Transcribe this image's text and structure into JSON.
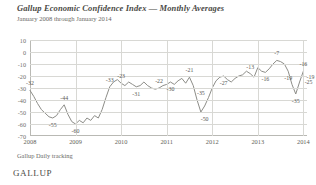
{
  "header": {
    "title": "Gallup Economic Confidence Index — Monthly Averages",
    "subtitle": "January 2008 through January 2014"
  },
  "footer": {
    "source": "Gallup Daily tracking",
    "logo": "GALLUP"
  },
  "chart_data": {
    "type": "line",
    "title": "Gallup Economic Confidence Index — Monthly Averages",
    "subtitle": "January 2008 through January 2014",
    "xlabel": "",
    "ylabel": "",
    "ylim": [
      -70,
      10
    ],
    "yticks": [
      10,
      0,
      -10,
      -20,
      -30,
      -40,
      -50,
      -60,
      -70
    ],
    "ytick_labels": [
      "10",
      "0",
      "-10",
      "-20",
      "-30",
      "-40",
      "-50",
      "-60",
      "-70"
    ],
    "xticks": [
      2008,
      2009,
      2010,
      2011,
      2012,
      2013,
      2014
    ],
    "xtick_labels": [
      "2008",
      "2009",
      "2010",
      "2011",
      "2012",
      "2013",
      "2014"
    ],
    "grid": true,
    "legend": false,
    "line_color": "#8d8d88",
    "x": [
      2008.0,
      2008.083,
      2008.167,
      2008.25,
      2008.333,
      2008.417,
      2008.5,
      2008.583,
      2008.667,
      2008.75,
      2008.833,
      2008.917,
      2009.0,
      2009.083,
      2009.167,
      2009.25,
      2009.333,
      2009.417,
      2009.5,
      2009.583,
      2009.667,
      2009.75,
      2009.833,
      2009.917,
      2010.0,
      2010.083,
      2010.167,
      2010.25,
      2010.333,
      2010.417,
      2010.5,
      2010.583,
      2010.667,
      2010.75,
      2010.833,
      2010.917,
      2011.0,
      2011.083,
      2011.167,
      2011.25,
      2011.333,
      2011.417,
      2011.5,
      2011.583,
      2011.667,
      2011.75,
      2011.833,
      2011.917,
      2012.0,
      2012.083,
      2012.167,
      2012.25,
      2012.333,
      2012.417,
      2012.5,
      2012.583,
      2012.667,
      2012.75,
      2012.833,
      2012.917,
      2013.0,
      2013.083,
      2013.167,
      2013.25,
      2013.333,
      2013.417,
      2013.5,
      2013.583,
      2013.667,
      2013.75,
      2013.833,
      2013.917,
      2014.0
    ],
    "values": [
      -32,
      -37,
      -43,
      -48,
      -51,
      -54,
      -55,
      -53,
      -48,
      -44,
      -52,
      -58,
      -60,
      -57,
      -59,
      -55,
      -57,
      -53,
      -55,
      -48,
      -38,
      -29,
      -25,
      -23,
      -26,
      -28,
      -25,
      -27,
      -29,
      -28,
      -25,
      -28,
      -30,
      -31,
      -30,
      -28,
      -27,
      -25,
      -27,
      -24,
      -22,
      -26,
      -21,
      -28,
      -40,
      -50,
      -45,
      -38,
      -30,
      -24,
      -21,
      -20,
      -23,
      -25,
      -22,
      -20,
      -19,
      -16,
      -18,
      -21,
      -13,
      -16,
      -17,
      -14,
      -10,
      -7,
      -8,
      -10,
      -16,
      -27,
      -35,
      -25,
      -16
    ],
    "point_labels": [
      {
        "text": "-32",
        "x": 2008.0,
        "y": -32,
        "pos": "above"
      },
      {
        "text": "-55",
        "x": 2008.5,
        "y": -55,
        "pos": "below"
      },
      {
        "text": "-44",
        "x": 2008.75,
        "y": -44,
        "pos": "above"
      },
      {
        "text": "-60",
        "x": 2009.0,
        "y": -60,
        "pos": "below"
      },
      {
        "text": "-33",
        "x": 2009.75,
        "y": -29,
        "pos": "above"
      },
      {
        "text": "-23",
        "x": 2010.0,
        "y": -26,
        "pos": "above"
      },
      {
        "text": "-31",
        "x": 2010.333,
        "y": -29,
        "pos": "below"
      },
      {
        "text": "-22",
        "x": 2010.833,
        "y": -30,
        "pos": "above"
      },
      {
        "text": "-30",
        "x": 2011.083,
        "y": -25,
        "pos": "below"
      },
      {
        "text": "-21",
        "x": 2011.5,
        "y": -21,
        "pos": "above"
      },
      {
        "text": "-35",
        "x": 2011.75,
        "y": -40,
        "pos": "above"
      },
      {
        "text": "-50",
        "x": 2011.833,
        "y": -50,
        "pos": "below"
      },
      {
        "text": "-27",
        "x": 2012.25,
        "y": -20,
        "pos": "below"
      },
      {
        "text": "-13",
        "x": 2012.833,
        "y": -18,
        "pos": "above"
      },
      {
        "text": "-16",
        "x": 2013.167,
        "y": -17,
        "pos": "below"
      },
      {
        "text": "-7",
        "x": 2013.417,
        "y": -7,
        "pos": "above"
      },
      {
        "text": "-19",
        "x": 2013.667,
        "y": -16,
        "pos": "below"
      },
      {
        "text": "-35",
        "x": 2013.833,
        "y": -35,
        "pos": "below"
      },
      {
        "text": "-25",
        "x": 2013.917,
        "y": -25,
        "pos": "right"
      },
      {
        "text": "-19",
        "x": 2013.958,
        "y": -21,
        "pos": "right"
      },
      {
        "text": "-16",
        "x": 2014.0,
        "y": -16,
        "pos": "above"
      }
    ]
  }
}
